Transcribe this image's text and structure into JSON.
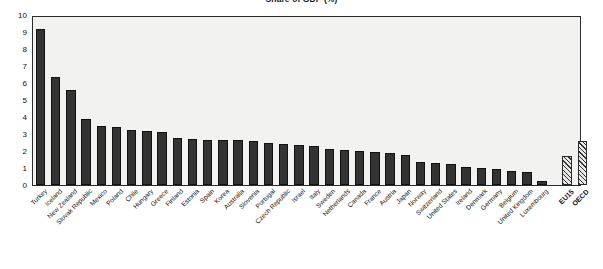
{
  "chart_data": {
    "type": "bar",
    "title": "Share of GDP (%)",
    "xlabel": "",
    "ylabel": "",
    "ylim": [
      0,
      10
    ],
    "ytick_labels": [
      "10",
      "9",
      "8",
      "7",
      "6",
      "5",
      "4",
      "3",
      "2",
      "1",
      "0"
    ],
    "ytick_values": [
      10,
      9,
      8,
      7,
      6,
      5,
      4,
      3,
      2,
      1,
      0
    ],
    "grid": false,
    "legend": "none",
    "categories": [
      "Turkey",
      "Iceland",
      "New Zealand",
      "Slovak Republic",
      "Mexico",
      "Poland",
      "Chile",
      "Hungary",
      "Greece",
      "Finland",
      "Estonia",
      "Spain",
      "Korea",
      "Australia",
      "Slovenia",
      "Portugal",
      "Czech Republic",
      "Israel",
      "Italy",
      "Sweden",
      "Netherlands",
      "Canada",
      "France",
      "Austria",
      "Japan",
      "Norway",
      "Switzerland",
      "United States",
      "Ireland",
      "Denmark",
      "Germany",
      "Belgium",
      "United Kingdom",
      "Luxembourg",
      "EU15",
      "OECD"
    ],
    "values": [
      9.3,
      6.4,
      5.65,
      3.9,
      3.5,
      3.45,
      3.3,
      3.2,
      3.15,
      2.8,
      2.75,
      2.7,
      2.7,
      2.65,
      2.6,
      2.5,
      2.45,
      2.4,
      2.3,
      2.15,
      2.1,
      2.0,
      1.95,
      1.9,
      1.8,
      1.35,
      1.3,
      1.25,
      1.1,
      1.0,
      0.95,
      0.85,
      0.75,
      0.25,
      1.75,
      2.6
    ],
    "series_styles": [
      {
        "name": "countries",
        "style": "solid-dark",
        "color": "#333333"
      },
      {
        "name": "aggregates",
        "style": "hatched",
        "color": "#2f2f2f"
      }
    ],
    "aggregate_start_index": 34,
    "aggregate_labels": [
      "EU15",
      "OECD"
    ]
  }
}
